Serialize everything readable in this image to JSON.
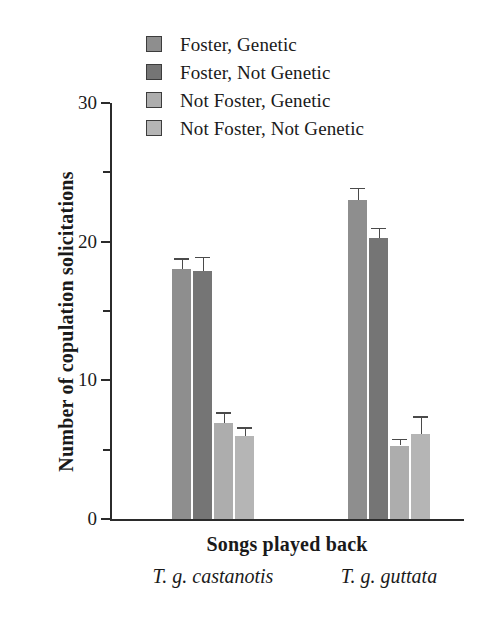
{
  "chart_data": {
    "type": "bar",
    "title": "",
    "xlabel": "Songs played back",
    "ylabel": "Number of copulation solicitations",
    "ylim": [
      0,
      30
    ],
    "yticks": [
      0,
      10,
      20,
      30
    ],
    "yticks_minor": [
      5,
      15,
      25
    ],
    "grid": false,
    "legend_position": "top-left",
    "categories": [
      "T. g. castanotis",
      "T. g. guttata"
    ],
    "series": [
      {
        "name": "Foster, Genetic",
        "color": "#8e8e8e",
        "values": [
          18.0,
          23.0
        ],
        "errors": [
          0.8,
          0.9
        ]
      },
      {
        "name": "Foster, Not Genetic",
        "color": "#757575",
        "values": [
          17.9,
          20.3
        ],
        "errors": [
          1.0,
          0.7
        ]
      },
      {
        "name": "Not Foster, Genetic",
        "color": "#adadad",
        "values": [
          6.9,
          5.3
        ],
        "errors": [
          0.8,
          0.5
        ]
      },
      {
        "name": "Not Foster, Not Genetic",
        "color": "#b5b5b5",
        "values": [
          6.0,
          6.1
        ],
        "errors": [
          0.6,
          1.3
        ]
      }
    ]
  },
  "legend": {
    "items": [
      {
        "label": "Foster, Genetic",
        "color": "#8e8e8e"
      },
      {
        "label": "Foster, Not Genetic",
        "color": "#757575"
      },
      {
        "label": "Not Foster, Genetic",
        "color": "#adadad"
      },
      {
        "label": "Not Foster, Not Genetic",
        "color": "#b5b5b5"
      }
    ]
  },
  "axis": {
    "y_title": "Number of copulation solicitations",
    "y_labels": [
      "30",
      "20",
      "10",
      "0"
    ],
    "x_title": "Songs played back",
    "x_group_labels": [
      "T. g. castanotis",
      "T. g. guttata"
    ]
  }
}
